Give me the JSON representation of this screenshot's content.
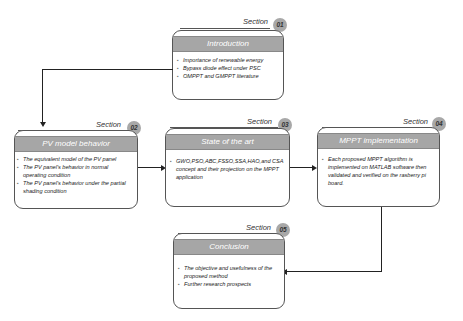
{
  "section_label": "Section",
  "sections": [
    {
      "number": "01",
      "title": "Introduction",
      "items": [
        "Importance of renewable energy",
        "Bypass diode effect under PSC",
        "OMPPT and GMPPT literature"
      ]
    },
    {
      "number": "02",
      "title": "PV model behavior",
      "items": [
        "The equivalent model of the PV panel",
        "The PV panel's behavior in normal operating condition",
        "The PV panel's behavior under the partial shading condition"
      ]
    },
    {
      "number": "03",
      "title": "State of the art",
      "items": [
        "GWO,PSO,ABC,FSSO,SSA,HAO,and CSA concept and their projection on the MPPT application"
      ]
    },
    {
      "number": "04",
      "title": "MPPT implementation",
      "items": [
        "Each proposed MPPT algorithm is implemented on MATLAB software then validated and verified on the rasberry pi board."
      ]
    },
    {
      "number": "05",
      "title": "Conclusion",
      "items": [
        "The objective and usefulness of the proposed method",
        "Further research prospects"
      ]
    }
  ],
  "colors": {
    "header_fill": "#a6a6a6",
    "badge_fill": "#a8a8a8",
    "border": "#555555",
    "arrow": "#222222"
  }
}
